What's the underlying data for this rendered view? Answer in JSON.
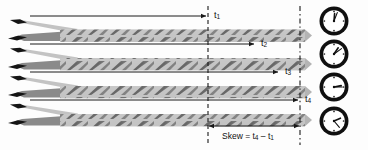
{
  "figure": {
    "type": "technical-diagram"
  },
  "time_labels": [
    {
      "id": "t1",
      "text": "t",
      "sub": "1",
      "x": 214,
      "y": 16,
      "arrow_end_x": 206,
      "row": 1
    },
    {
      "id": "t2",
      "text": "t",
      "sub": "2",
      "x": 261,
      "y": 44,
      "arrow_end_x": 254,
      "row": 2
    },
    {
      "id": "t3",
      "text": "t",
      "sub": "3",
      "x": 285,
      "y": 72,
      "arrow_end_x": 278,
      "row": 3
    },
    {
      "id": "t4",
      "text": "t",
      "sub": "4",
      "x": 305,
      "y": 100,
      "arrow_end_x": 298,
      "row": 4
    }
  ],
  "skew": {
    "prefix": "Skew = t",
    "sub_a": "4",
    "minus": " – t",
    "sub_b": "1",
    "full_text": "Skew = t4 – t1",
    "label_x": 222,
    "label_y": 136,
    "arrow_left_x": 208,
    "arrow_right_x": 300,
    "arrow_y": 126
  },
  "reference_lines": [
    {
      "id": "left-dashed-line",
      "x": 208,
      "y_top": 6,
      "y_bottom": 145,
      "style": "dashed"
    },
    {
      "id": "right-dashed-line",
      "x": 300,
      "y_top": 6,
      "y_bottom": 145,
      "style": "dash-dot"
    }
  ],
  "cables": [
    {
      "id": "cable-1",
      "y": 36,
      "arrow_y": 16,
      "arrow_x_start": 30,
      "arrow_x_end": 206
    },
    {
      "id": "cable-2",
      "y": 65,
      "arrow_y": 44,
      "arrow_x_start": 30,
      "arrow_x_end": 254
    },
    {
      "id": "cable-3",
      "y": 93,
      "arrow_y": 72,
      "arrow_x_start": 30,
      "arrow_x_end": 278
    },
    {
      "id": "cable-4",
      "y": 121,
      "arrow_y": 100,
      "arrow_x_start": 30,
      "arrow_x_end": 298
    }
  ],
  "clocks": [
    {
      "id": "clock-1",
      "cx": 334,
      "cy": 21,
      "r": 15,
      "hour_angle": 5,
      "minute_angle": 22,
      "reading": "12:01"
    },
    {
      "id": "clock-2",
      "cx": 334,
      "cy": 54,
      "r": 15,
      "hour_angle": 35,
      "minute_angle": 60,
      "reading": "1:10"
    },
    {
      "id": "clock-3",
      "cx": 334,
      "cy": 87,
      "r": 15,
      "hour_angle": 78,
      "minute_angle": 90,
      "reading": "3:15"
    },
    {
      "id": "clock-4",
      "cx": 334,
      "cy": 121,
      "r": 15,
      "hour_angle": 100,
      "minute_angle": 125,
      "reading": "4:20"
    }
  ],
  "colors": {
    "line": "#1a1a1a",
    "jacket_light": "#c9c9c9",
    "jacket_mid": "#a8a8a8",
    "twist_dark": "#6e6e6e",
    "twist_darker": "#4a4a4a",
    "wire_tip": "#111111",
    "background": "#fdfdfd",
    "clock_body": "#111111",
    "clock_face": "#ffffff"
  }
}
